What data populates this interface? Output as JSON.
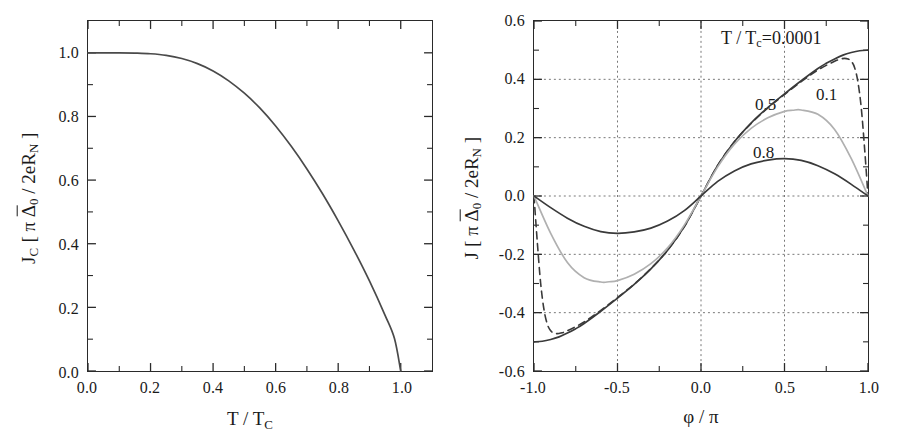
{
  "figure": {
    "background": "#ffffff",
    "panel_count": 2
  },
  "left_panel": {
    "name": "critical-current-vs-temperature",
    "y_axis_title_parts": {
      "symbol": "J",
      "sub": "C",
      "open": "[ π ",
      "delta": "Δ",
      "delta_sub": "0",
      "rest": " / 2eR",
      "rest_sub": "N",
      "close": " ]"
    },
    "x_axis_title_parts": {
      "num": "T / T",
      "sub": "C"
    },
    "x_ticks": [
      "0.0",
      "0.2",
      "0.4",
      "0.6",
      "0.8",
      "1.0"
    ],
    "y_ticks": [
      "0.0",
      "0.2",
      "0.4",
      "0.6",
      "0.8",
      "1.0"
    ],
    "grid": "none",
    "curve_color": "#4a4a4a"
  },
  "right_panel": {
    "name": "current-phase-relation",
    "y_axis_title_parts": {
      "symbol": "J",
      "sub": "",
      "open": "[ π ",
      "delta": "Δ",
      "delta_sub": "0",
      "rest": " / 2eR",
      "rest_sub": "N",
      "close": " ]"
    },
    "x_axis_title_parts": {
      "num": "φ / π",
      "sub": ""
    },
    "x_ticks": [
      "-1.0",
      "-0.5",
      "0.0",
      "0.5",
      "1.0"
    ],
    "y_ticks": [
      "0.6",
      "0.4",
      "0.2",
      "0.0",
      "-0.2",
      "-0.4",
      "-0.6"
    ],
    "grid": "dotted",
    "legend_prefix": "T / T",
    "legend_prefix_sub": "c",
    "legend_value": "=0.0001",
    "curve_labels": [
      {
        "text": "0.5",
        "for": "T/Tc = 0.5"
      },
      {
        "text": "0.1",
        "for": "T/Tc = 0.1"
      },
      {
        "text": "0.8",
        "for": "T/Tc = 0.8"
      }
    ]
  },
  "chart_data": [
    {
      "type": "line",
      "name": "critical-current-vs-temperature",
      "title": "",
      "xlabel": "T / T_C",
      "ylabel": "J_C [ π Δ̃0 / 2eR_N ]",
      "xlim": [
        0.0,
        1.1
      ],
      "ylim": [
        0.0,
        1.1
      ],
      "xticks": [
        0.0,
        0.2,
        0.4,
        0.6,
        0.8,
        1.0
      ],
      "yticks": [
        0.0,
        0.2,
        0.4,
        0.6,
        0.8,
        1.0
      ],
      "grid": false,
      "legend": "none",
      "series": [
        {
          "name": "Jc(T)",
          "color": "#4a4a4a",
          "style": "solid",
          "x": [
            0.0,
            0.05,
            0.1,
            0.15,
            0.2,
            0.25,
            0.3,
            0.35,
            0.4,
            0.45,
            0.5,
            0.55,
            0.6,
            0.65,
            0.7,
            0.75,
            0.8,
            0.85,
            0.9,
            0.95,
            0.98,
            1.0
          ],
          "y": [
            1.0,
            1.0,
            1.0,
            0.999,
            0.997,
            0.992,
            0.982,
            0.966,
            0.943,
            0.912,
            0.873,
            0.826,
            0.77,
            0.706,
            0.635,
            0.557,
            0.472,
            0.381,
            0.283,
            0.175,
            0.102,
            0.0
          ]
        }
      ]
    },
    {
      "type": "line",
      "name": "current-phase-relation",
      "title": "",
      "xlabel": "φ / π",
      "ylabel": "J [ π Δ̃0 / 2eR_N ]",
      "xlim": [
        -1.0,
        1.0
      ],
      "ylim": [
        -0.6,
        0.6
      ],
      "xticks": [
        -1.0,
        -0.5,
        0.0,
        0.5,
        1.0
      ],
      "yticks": [
        -0.6,
        -0.4,
        -0.2,
        0.0,
        0.2,
        0.4,
        0.6
      ],
      "grid": true,
      "legend": "inline-labels",
      "series": [
        {
          "name": "T/Tc=0.0001",
          "color": "#3a3a3a",
          "style": "solid",
          "x": [
            -1.0,
            -0.95,
            -0.9,
            -0.85,
            -0.8,
            -0.75,
            -0.7,
            -0.6,
            -0.5,
            -0.4,
            -0.3,
            -0.2,
            -0.1,
            0.0,
            0.1,
            0.2,
            0.3,
            0.4,
            0.5,
            0.6,
            0.7,
            0.75,
            0.8,
            0.85,
            0.9,
            0.95,
            1.0
          ],
          "y": [
            -0.5,
            -0.498,
            -0.492,
            -0.483,
            -0.47,
            -0.455,
            -0.437,
            -0.395,
            -0.35,
            -0.303,
            -0.25,
            -0.186,
            -0.105,
            0.0,
            0.105,
            0.186,
            0.25,
            0.303,
            0.35,
            0.395,
            0.437,
            0.455,
            0.47,
            0.483,
            0.492,
            0.498,
            0.5
          ]
        },
        {
          "name": "T/Tc=0.1",
          "color": "#3a3a3a",
          "style": "dashed",
          "x": [
            -1.0,
            -0.98,
            -0.96,
            -0.94,
            -0.92,
            -0.9,
            -0.88,
            -0.86,
            -0.84,
            -0.8,
            -0.7,
            -0.6,
            -0.5,
            -0.4,
            -0.3,
            -0.2,
            -0.1,
            0.0,
            0.1,
            0.2,
            0.3,
            0.4,
            0.5,
            0.6,
            0.7,
            0.8,
            0.84,
            0.86,
            0.88,
            0.9,
            0.92,
            0.94,
            0.96,
            0.98,
            1.0
          ],
          "y": [
            0.0,
            -0.16,
            -0.3,
            -0.39,
            -0.44,
            -0.462,
            -0.47,
            -0.472,
            -0.47,
            -0.462,
            -0.432,
            -0.392,
            -0.348,
            -0.302,
            -0.249,
            -0.186,
            -0.105,
            0.0,
            0.105,
            0.186,
            0.249,
            0.302,
            0.348,
            0.392,
            0.432,
            0.462,
            0.47,
            0.472,
            0.47,
            0.462,
            0.44,
            0.39,
            0.3,
            0.16,
            0.0
          ]
        },
        {
          "name": "T/Tc=0.5",
          "color": "#b0b0b0",
          "style": "solid",
          "x": [
            -1.0,
            -0.9,
            -0.8,
            -0.7,
            -0.6,
            -0.55,
            -0.5,
            -0.4,
            -0.3,
            -0.2,
            -0.1,
            0.0,
            0.1,
            0.2,
            0.3,
            0.4,
            0.5,
            0.55,
            0.6,
            0.7,
            0.8,
            0.9,
            1.0
          ],
          "y": [
            0.0,
            -0.128,
            -0.228,
            -0.28,
            -0.295,
            -0.294,
            -0.29,
            -0.268,
            -0.232,
            -0.178,
            -0.1,
            0.0,
            0.1,
            0.178,
            0.232,
            0.268,
            0.29,
            0.294,
            0.295,
            0.28,
            0.228,
            0.128,
            0.0
          ]
        },
        {
          "name": "T/Tc=0.8",
          "color": "#3a3a3a",
          "style": "solid",
          "x": [
            -1.0,
            -0.9,
            -0.8,
            -0.7,
            -0.6,
            -0.5,
            -0.4,
            -0.3,
            -0.2,
            -0.1,
            0.0,
            0.1,
            0.2,
            0.3,
            0.4,
            0.5,
            0.6,
            0.7,
            0.8,
            0.9,
            1.0
          ],
          "y": [
            0.0,
            -0.04,
            -0.076,
            -0.104,
            -0.122,
            -0.128,
            -0.123,
            -0.11,
            -0.086,
            -0.05,
            0.0,
            0.05,
            0.086,
            0.11,
            0.123,
            0.128,
            0.122,
            0.104,
            0.076,
            0.04,
            0.0
          ]
        }
      ]
    }
  ]
}
